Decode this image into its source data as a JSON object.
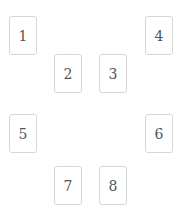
{
  "board": {
    "cards": [
      {
        "label": "1"
      },
      {
        "label": "2"
      },
      {
        "label": "3"
      },
      {
        "label": "4"
      },
      {
        "label": "5"
      },
      {
        "label": "6"
      },
      {
        "label": "7"
      },
      {
        "label": "8"
      }
    ]
  },
  "colors": {
    "background": "#ffffff",
    "card_border": "#d6d6d6",
    "card_text": "#555555"
  }
}
